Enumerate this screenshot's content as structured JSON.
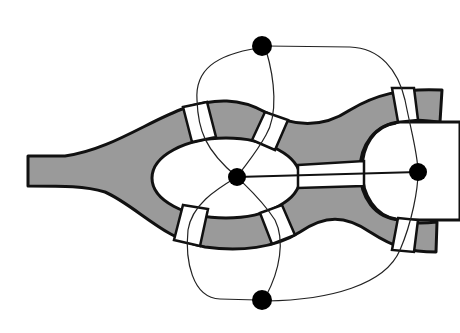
{
  "colors": {
    "river": "#9a9a9a",
    "land": "#ffffff",
    "outline": "#111111",
    "node": "#000000",
    "edge": "#222222"
  },
  "landmasses": [
    {
      "id": "north-bank",
      "node": {
        "x": 262,
        "y": 46
      }
    },
    {
      "id": "south-bank",
      "node": {
        "x": 262,
        "y": 300
      }
    },
    {
      "id": "kneiphof-island",
      "node": {
        "x": 237,
        "y": 177
      }
    },
    {
      "id": "east-landmass",
      "node": {
        "x": 418,
        "y": 172
      }
    }
  ],
  "bridges": [
    {
      "id": "bridge-1",
      "connects": [
        "north-bank",
        "kneiphof-island"
      ]
    },
    {
      "id": "bridge-2",
      "connects": [
        "north-bank",
        "kneiphof-island"
      ]
    },
    {
      "id": "bridge-3",
      "connects": [
        "south-bank",
        "kneiphof-island"
      ]
    },
    {
      "id": "bridge-4",
      "connects": [
        "south-bank",
        "kneiphof-island"
      ]
    },
    {
      "id": "bridge-5",
      "connects": [
        "kneiphof-island",
        "east-landmass"
      ]
    },
    {
      "id": "bridge-6",
      "connects": [
        "north-bank",
        "east-landmass"
      ]
    },
    {
      "id": "bridge-7",
      "connects": [
        "south-bank",
        "east-landmass"
      ]
    }
  ],
  "graph": {
    "node_count": 4,
    "edge_count": 7
  }
}
